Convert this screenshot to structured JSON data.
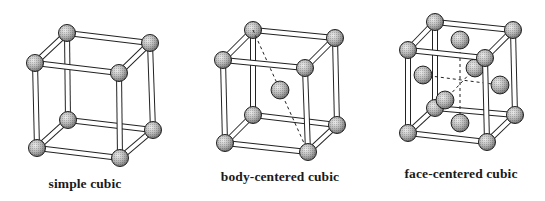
{
  "figure": {
    "panels": [
      {
        "id": "simple",
        "label": "simple cubic",
        "label_pos": [
          85,
          187
        ],
        "corners": {
          "btl": [
            67,
            33
          ],
          "btr": [
            150,
            43
          ],
          "ftl": [
            35,
            63
          ],
          "ftr": [
            119,
            73
          ],
          "bbl": [
            68,
            120
          ],
          "bbr": [
            153,
            130
          ],
          "fbl": [
            37,
            148
          ],
          "fbr": [
            120,
            158
          ]
        },
        "extra_atoms": [],
        "dashed": []
      },
      {
        "id": "bcc",
        "label": "body-centered cubic",
        "label_pos": [
          280,
          180
        ],
        "corners": {
          "btl": [
            253,
            30
          ],
          "btr": [
            335,
            38
          ],
          "ftl": [
            223,
            60
          ],
          "ftr": [
            305,
            68
          ],
          "bbl": [
            253,
            115
          ],
          "bbr": [
            337,
            125
          ],
          "fbl": [
            225,
            143
          ],
          "fbr": [
            308,
            152
          ]
        },
        "extra_atoms": [
          {
            "name": "body-center-atom",
            "pos": [
              280,
              90
            ]
          }
        ],
        "dashed": [
          [
            [
              253,
              30
            ],
            [
              308,
              152
            ]
          ]
        ]
      },
      {
        "id": "fcc",
        "label": "face-centered cubic",
        "label_pos": [
          461,
          177
        ],
        "corners": {
          "btl": [
            435,
            22
          ],
          "btr": [
            513,
            30
          ],
          "ftl": [
            408,
            50
          ],
          "ftr": [
            485,
            58
          ],
          "bbl": [
            435,
            108
          ],
          "bbr": [
            515,
            115
          ],
          "fbl": [
            408,
            133
          ],
          "fbr": [
            487,
            142
          ]
        },
        "extra_atoms": [
          {
            "name": "face-top-atom",
            "pos": [
              460,
              40
            ]
          },
          {
            "name": "face-back-atom",
            "pos": [
              475,
              68
            ]
          },
          {
            "name": "face-left-atom",
            "pos": [
              423,
              75
            ]
          },
          {
            "name": "face-right-atom",
            "pos": [
              500,
              85
            ]
          },
          {
            "name": "face-front-atom",
            "pos": [
              445,
              100
            ]
          },
          {
            "name": "face-bottom-atom",
            "pos": [
              460,
              123
            ]
          }
        ],
        "dashed": [
          [
            [
              460,
              40
            ],
            [
              460,
              123
            ]
          ],
          [
            [
              423,
              75
            ],
            [
              500,
              85
            ]
          ],
          [
            [
              475,
              68
            ],
            [
              445,
              100
            ]
          ]
        ]
      }
    ],
    "atom_radius": 8.5,
    "rod_width": 4,
    "colors": {
      "atom_light": "#d8d8d8",
      "atom_dark": "#7a7a7a",
      "outline": "#222222",
      "rod_fill": "#ffffff"
    }
  }
}
